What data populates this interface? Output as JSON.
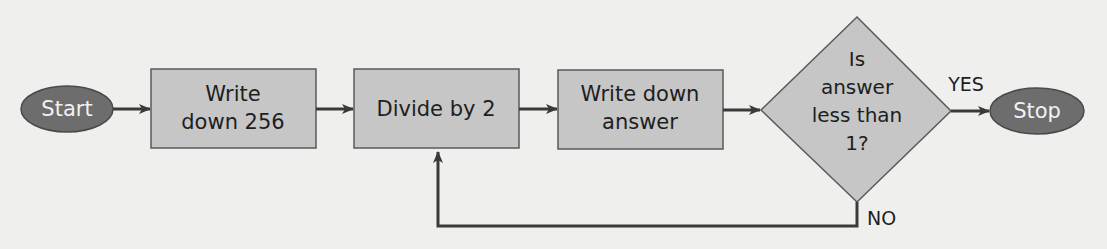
{
  "diagram": {
    "type": "flowchart",
    "colors": {
      "background": "#efefed",
      "terminal_fill": "#6d6d6d",
      "terminal_stroke": "#4a4a4a",
      "terminal_text": "#f2f2f2",
      "process_fill": "#c6c6c6",
      "process_stroke": "#5a5a5a",
      "text": "#1e1e1e",
      "arrow": "#3a3a3a"
    },
    "nodes": {
      "start": {
        "label": "Start",
        "shape": "ellipse"
      },
      "write256": {
        "lines": [
          "Write",
          "down 256"
        ],
        "shape": "rect"
      },
      "divide": {
        "lines": [
          "Divide by 2"
        ],
        "shape": "rect"
      },
      "writeanswer": {
        "lines": [
          "Write down",
          "answer"
        ],
        "shape": "rect"
      },
      "decision": {
        "lines": [
          "Is",
          "answer",
          "less than",
          "1?"
        ],
        "shape": "diamond"
      },
      "stop": {
        "label": "Stop",
        "shape": "ellipse"
      }
    },
    "edges": [
      {
        "from": "start",
        "to": "write256",
        "label": ""
      },
      {
        "from": "write256",
        "to": "divide",
        "label": ""
      },
      {
        "from": "divide",
        "to": "writeanswer",
        "label": ""
      },
      {
        "from": "writeanswer",
        "to": "decision",
        "label": ""
      },
      {
        "from": "decision",
        "to": "stop",
        "label": "YES"
      },
      {
        "from": "decision",
        "to": "divide",
        "label": "NO"
      }
    ],
    "labels": {
      "yes": "YES",
      "no": "NO"
    }
  }
}
